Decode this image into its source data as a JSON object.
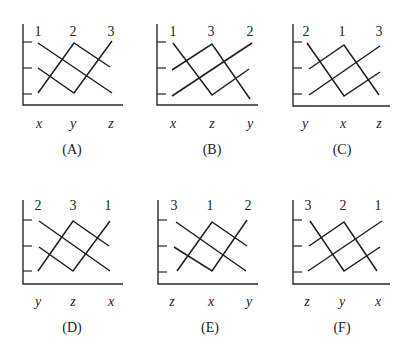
{
  "figure": {
    "panels": [
      {
        "id": "A",
        "caption": "(A)",
        "axis": {
          "x0": 23,
          "yTop": 24,
          "yBot": 105,
          "xRight": 123,
          "ticks": [
            42,
            68,
            94
          ]
        },
        "top_labels": [
          {
            "text": "1",
            "x": 38,
            "y": 32
          },
          {
            "text": "2",
            "x": 73,
            "y": 32
          },
          {
            "text": "3",
            "x": 111,
            "y": 32
          }
        ],
        "x_labels": [
          {
            "text": "x",
            "x": 39,
            "y": 124
          },
          {
            "text": "y",
            "x": 73,
            "y": 124
          },
          {
            "text": "z",
            "x": 111,
            "y": 124
          }
        ],
        "caption_pos": {
          "x": 72,
          "y": 150
        },
        "lines": [
          [
            [
              38,
              43
            ],
            [
              112,
              93
            ]
          ],
          [
            [
              38,
              68
            ],
            [
              74,
              93
            ],
            [
              112,
              41
            ]
          ],
          [
            [
              38,
              93
            ],
            [
              74,
              43
            ],
            [
              110,
              67
            ]
          ]
        ]
      },
      {
        "id": "B",
        "caption": "(B)",
        "axis": {
          "x0": 157,
          "yTop": 24,
          "yBot": 105,
          "xRight": 258,
          "ticks": [
            42,
            68,
            94
          ]
        },
        "top_labels": [
          {
            "text": "1",
            "x": 173,
            "y": 32
          },
          {
            "text": "3",
            "x": 211,
            "y": 32
          },
          {
            "text": "2",
            "x": 250,
            "y": 32
          }
        ],
        "x_labels": [
          {
            "text": "x",
            "x": 173,
            "y": 124
          },
          {
            "text": "z",
            "x": 212,
            "y": 124
          },
          {
            "text": "y",
            "x": 250,
            "y": 124
          }
        ],
        "caption_pos": {
          "x": 212,
          "y": 150
        },
        "lines": [
          [
            [
              173,
              43
            ],
            [
              212,
              95
            ],
            [
              249,
              69
            ]
          ],
          [
            [
              172,
              70
            ],
            [
              212,
              44
            ],
            [
              250,
              99
            ]
          ],
          [
            [
              172,
              96
            ],
            [
              252,
              43
            ]
          ]
        ]
      },
      {
        "id": "C",
        "caption": "(C)",
        "axis": {
          "x0": 293,
          "yTop": 24,
          "yBot": 106,
          "xRight": 390,
          "ticks": [
            42,
            68,
            94
          ]
        },
        "top_labels": [
          {
            "text": "2",
            "x": 306,
            "y": 32
          },
          {
            "text": "1",
            "x": 342,
            "y": 32
          },
          {
            "text": "3",
            "x": 379,
            "y": 32
          }
        ],
        "x_labels": [
          {
            "text": "y",
            "x": 305,
            "y": 124
          },
          {
            "text": "x",
            "x": 343,
            "y": 124
          },
          {
            "text": "z",
            "x": 379,
            "y": 124
          }
        ],
        "caption_pos": {
          "x": 342,
          "y": 150
        },
        "lines": [
          [
            [
              307,
              43
            ],
            [
              344,
              96
            ],
            [
              380,
              72
            ]
          ],
          [
            [
              309,
              69
            ],
            [
              344,
              45
            ],
            [
              379,
              95
            ]
          ],
          [
            [
              309,
              95
            ],
            [
              380,
              46
            ]
          ]
        ]
      },
      {
        "id": "D",
        "caption": "(D)",
        "axis": {
          "x0": 23,
          "yTop": 200,
          "yBot": 284,
          "xRight": 123,
          "ticks": [
            220,
            246,
            271
          ]
        },
        "top_labels": [
          {
            "text": "2",
            "x": 38,
            "y": 206
          },
          {
            "text": "3",
            "x": 73,
            "y": 206
          },
          {
            "text": "1",
            "x": 108,
            "y": 206
          }
        ],
        "x_labels": [
          {
            "text": "y",
            "x": 38,
            "y": 302
          },
          {
            "text": "z",
            "x": 73,
            "y": 302
          },
          {
            "text": "x",
            "x": 111,
            "y": 302
          }
        ],
        "caption_pos": {
          "x": 72,
          "y": 328
        },
        "lines": [
          [
            [
              39,
              221
            ],
            [
              110,
              271
            ]
          ],
          [
            [
              39,
              247
            ],
            [
              73,
              271
            ],
            [
              110,
              221
            ]
          ],
          [
            [
              38,
              271
            ],
            [
              73,
              221
            ],
            [
              109,
              246
            ]
          ]
        ]
      },
      {
        "id": "E",
        "caption": "(E)",
        "axis": {
          "x0": 158,
          "yTop": 200,
          "yBot": 284,
          "xRight": 258,
          "ticks": [
            220,
            246,
            272
          ]
        },
        "top_labels": [
          {
            "text": "3",
            "x": 174,
            "y": 206
          },
          {
            "text": "1",
            "x": 210,
            "y": 206
          },
          {
            "text": "2",
            "x": 248,
            "y": 206
          }
        ],
        "x_labels": [
          {
            "text": "z",
            "x": 172,
            "y": 302
          },
          {
            "text": "x",
            "x": 211,
            "y": 302
          },
          {
            "text": "y",
            "x": 249,
            "y": 302
          }
        ],
        "caption_pos": {
          "x": 210,
          "y": 328
        },
        "lines": [
          [
            [
              176,
              222
            ],
            [
              246,
              271
            ]
          ],
          [
            [
              174,
              247
            ],
            [
              212,
              271
            ],
            [
              247,
              220
            ]
          ],
          [
            [
              177,
              271
            ],
            [
              212,
              222
            ],
            [
              247,
              246
            ]
          ]
        ]
      },
      {
        "id": "F",
        "caption": "(F)",
        "axis": {
          "x0": 293,
          "yTop": 200,
          "yBot": 284,
          "xRight": 390,
          "ticks": [
            220,
            246,
            272
          ]
        },
        "top_labels": [
          {
            "text": "3",
            "x": 308,
            "y": 206
          },
          {
            "text": "2",
            "x": 343,
            "y": 206
          },
          {
            "text": "1",
            "x": 378,
            "y": 206
          }
        ],
        "x_labels": [
          {
            "text": "z",
            "x": 307,
            "y": 302
          },
          {
            "text": "y",
            "x": 342,
            "y": 302
          },
          {
            "text": "x",
            "x": 378,
            "y": 302
          }
        ],
        "caption_pos": {
          "x": 342,
          "y": 328
        },
        "lines": [
          [
            [
              310,
              221
            ],
            [
              344,
              271
            ],
            [
              380,
              247
            ]
          ],
          [
            [
              309,
              246
            ],
            [
              344,
              222
            ],
            [
              377,
              271
            ]
          ],
          [
            [
              308,
              271
            ],
            [
              382,
              221
            ]
          ]
        ]
      }
    ]
  }
}
